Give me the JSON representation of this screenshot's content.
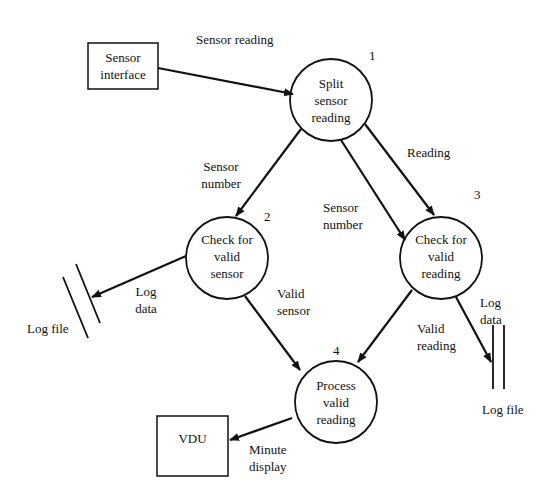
{
  "diagram": {
    "type": "data-flow-diagram",
    "external_entities": [
      {
        "id": "sensor_interface",
        "label_line1": "Sensor",
        "label_line2": "interface"
      },
      {
        "id": "vdu",
        "label": "VDU"
      }
    ],
    "processes": [
      {
        "number": "1",
        "line1": "Split",
        "line2": "sensor",
        "line3": "reading"
      },
      {
        "number": "2",
        "line1": "Check for",
        "line2": "valid",
        "line3": "sensor"
      },
      {
        "number": "3",
        "line1": "Check for",
        "line2": "valid",
        "line3": "reading"
      },
      {
        "number": "4",
        "line1": "Process",
        "line2": "valid",
        "line3": "reading"
      }
    ],
    "data_stores": [
      {
        "id": "log_file_left",
        "label": "Log file"
      },
      {
        "id": "log_file_right",
        "label": "Log file"
      }
    ],
    "flows": {
      "sensor_reading": "Sensor reading",
      "sensor_number_a_1": "Sensor",
      "sensor_number_a_2": "number",
      "reading": "Reading",
      "sensor_number_b_1": "Sensor",
      "sensor_number_b_2": "number",
      "log_data_left_1": "Log",
      "log_data_left_2": "data",
      "valid_sensor_1": "Valid",
      "valid_sensor_2": "sensor",
      "valid_reading_1": "Valid",
      "valid_reading_2": "reading",
      "log_data_right_1": "Log",
      "log_data_right_2": "data",
      "minute_display_1": "Minute",
      "minute_display_2": "display"
    }
  }
}
